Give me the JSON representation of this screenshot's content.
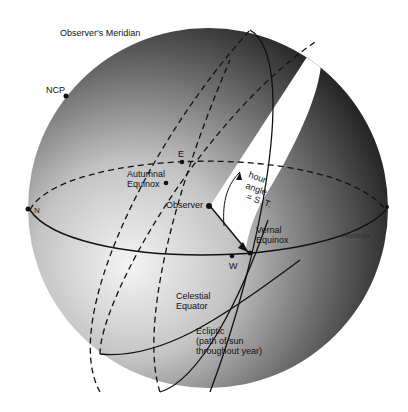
{
  "diagram": {
    "colors": {
      "sphere_light": "#f2f2f2",
      "sphere_mid": "#9a9a9a",
      "sphere_dark": "#1e1e1e",
      "line": "#111111",
      "wedge": "#ffffff"
    },
    "labels": {
      "observers_meridian": "Observer's Meridian",
      "ncp": "NCP",
      "e": "E",
      "autumnal_equinox_1": "Autumnal",
      "autumnal_equinox_2": "Equinox",
      "n": "N",
      "observer": "Observer",
      "hour_angle_1": "hour",
      "hour_angle_2": "angle",
      "hour_angle_3": "= S. T.",
      "vernal_equinox_1": "Vernal",
      "vernal_equinox_2": "Equinox",
      "horizon": "Horizon",
      "w": "W",
      "celestial_equator_1": "Celestial",
      "celestial_equator_2": "Equator",
      "ecliptic_1": "Ecliptic",
      "ecliptic_2": "(path of sun",
      "ecliptic_3": "throughout year)"
    }
  }
}
